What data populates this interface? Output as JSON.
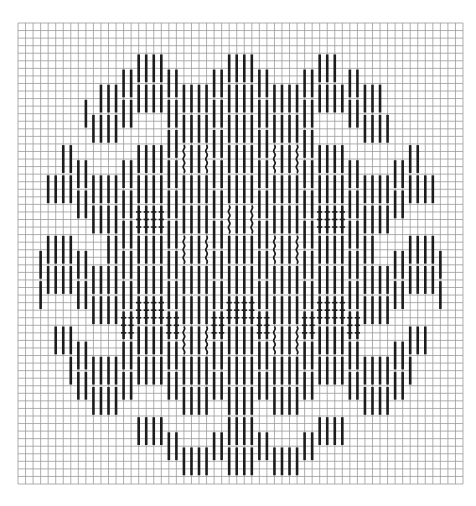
{
  "diagram": {
    "title": "Needlepoint stitch chart",
    "kind": "bargello-style vertical stitch diagram on square grid",
    "canvas": {
      "width": 476,
      "height": 506,
      "background": "#ffffff"
    },
    "grid": {
      "left": 18,
      "top": 23,
      "right": 463,
      "bottom": 484,
      "cell": 7.55,
      "line_color": "#9a9a9a",
      "line_width": 0.8,
      "border_color": "#b0b0b0"
    },
    "stitches": {
      "color": "#1c1c1c",
      "width": 2.6,
      "length_cells": 4,
      "pair_gap_cells": 1,
      "pair_step_cols": 2,
      "pair_step_rows": 2,
      "zigzag_period_cols": 12,
      "band_period_rows": 12,
      "gap_color": "#ffffff"
    },
    "layout": {
      "center_x": 240,
      "center_y": 255,
      "outer_radius_x": 205,
      "outer_radius_y": 215,
      "inner_radius_x": 135,
      "inner_radius_y": 150,
      "wavy_zone_radius": 120
    },
    "stitch_types": [
      {
        "name": "straight",
        "description": "plain vertical stitch over 4 threads"
      },
      {
        "name": "wavy",
        "description": "wavy vertical stitch in central filler"
      },
      {
        "name": "crossed",
        "description": "vertical stitch with tie-down crosses in diamond centers"
      }
    ],
    "motif_centers": [
      {
        "x": 150,
        "y": 200
      },
      {
        "x": 330,
        "y": 200
      },
      {
        "x": 240,
        "y": 295
      },
      {
        "x": 150,
        "y": 295
      },
      {
        "x": 330,
        "y": 295
      }
    ]
  }
}
